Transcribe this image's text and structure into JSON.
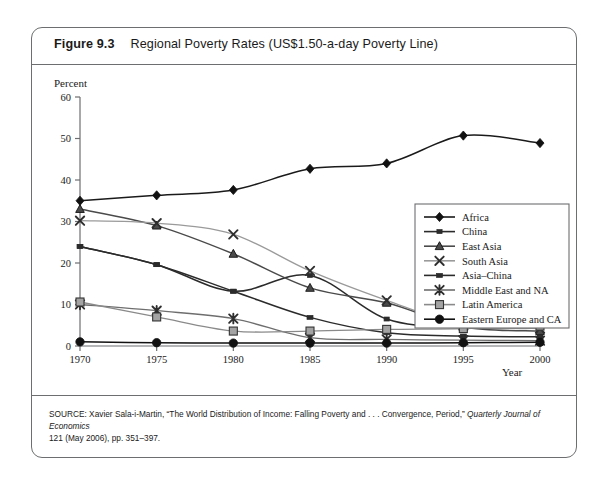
{
  "figure": {
    "number": "Figure 9.3",
    "title": "Regional Poverty Rates (US$1.50-a-day Poverty Line)",
    "source_line1_a": "SOURCE: Xavier Sala-i-Martin, “The World Distribution of Income: Falling Poverty and . . . Convergence, Period,” ",
    "source_line1_b": "Quarterly Journal of Economics",
    "source_line2": "121 (May 2006), pp. 351–397."
  },
  "chart_data": {
    "type": "line",
    "title": "Regional Poverty Rates (US$1.50-a-day Poverty Line)",
    "xlabel": "Year",
    "ylabel": "Percent",
    "x": [
      1970,
      1975,
      1980,
      1985,
      1990,
      1995,
      2000
    ],
    "xlim": [
      1970,
      2000
    ],
    "ylim": [
      0,
      60
    ],
    "yticks": [
      0,
      10,
      20,
      30,
      40,
      50,
      60
    ],
    "xticks": [
      "1970",
      "1975",
      "1980",
      "1985",
      "1990",
      "1995",
      "2000"
    ],
    "grid": false,
    "legend_position": "right-middle",
    "series": [
      {
        "name": "Africa",
        "marker": "diamond",
        "color": "#1a1a1a",
        "values": [
          35.0,
          36.3,
          37.6,
          42.7,
          44.0,
          50.7,
          48.9
        ]
      },
      {
        "name": "China",
        "marker": "small-square",
        "color": "#2b2b2b",
        "values": [
          24.0,
          19.6,
          13.2,
          17.0,
          6.5,
          4.6,
          4.4
        ]
      },
      {
        "name": "East Asia",
        "marker": "triangle",
        "color": "#4a4a4a",
        "values": [
          33.0,
          29.0,
          22.2,
          14.0,
          10.4,
          4.6,
          3.6
        ]
      },
      {
        "name": "South Asia",
        "marker": "x-thin",
        "color": "#9a9a9a",
        "values": [
          30.2,
          29.6,
          26.9,
          18.1,
          11.0,
          5.0,
          4.2
        ]
      },
      {
        "name": "Asia–China",
        "marker": "rect",
        "color": "#2b2b2b",
        "values": [
          24.0,
          19.6,
          13.2,
          6.9,
          3.2,
          2.4,
          2.2
        ]
      },
      {
        "name": "Middle East and NA",
        "marker": "asterisk",
        "color": "#6e6e6e",
        "values": [
          10.0,
          8.5,
          6.6,
          2.0,
          1.6,
          1.4,
          1.3
        ]
      },
      {
        "name": "Latin America",
        "marker": "square",
        "color": "#8a8a8a",
        "values": [
          10.6,
          7.0,
          3.6,
          3.6,
          4.0,
          4.2,
          4.8
        ]
      },
      {
        "name": "Eastern Europe and CA",
        "marker": "circle",
        "color": "#111111",
        "values": [
          1.0,
          0.8,
          0.7,
          0.7,
          0.7,
          0.8,
          0.9
        ]
      }
    ]
  }
}
